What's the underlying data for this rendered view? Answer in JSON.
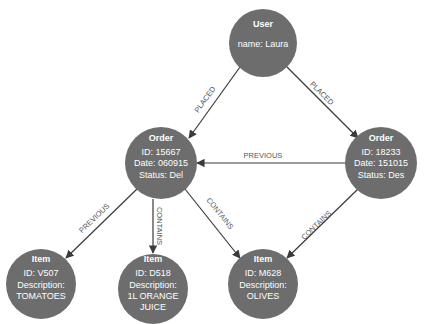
{
  "diagram": {
    "type": "graph",
    "colors": {
      "node_fill": "#6d6d6d",
      "node_text": "#ffffff",
      "edge": "#3a3a3a",
      "edge_label": "#555555",
      "background": "#ffffff"
    },
    "nodes": [
      {
        "id": "user",
        "title": "User",
        "lines": [
          "name: Laura"
        ]
      },
      {
        "id": "order1",
        "title": "Order",
        "lines": [
          "ID: 15667",
          "Date: 060915",
          "Status: Del"
        ]
      },
      {
        "id": "order2",
        "title": "Order",
        "lines": [
          "ID: 18233",
          "Date: 151015",
          "Status: Des"
        ]
      },
      {
        "id": "item1",
        "title": "Item",
        "lines": [
          "ID: V507",
          "Description:",
          "TOMATOES"
        ]
      },
      {
        "id": "item2",
        "title": "Item",
        "lines": [
          "ID: D518",
          "Description:",
          "1L ORANGE",
          "JUICE"
        ]
      },
      {
        "id": "item3",
        "title": "Item",
        "lines": [
          "ID: M628",
          "Description:",
          "OLIVES"
        ]
      }
    ],
    "edges": [
      {
        "from": "user",
        "to": "order1",
        "label": "PLACED"
      },
      {
        "from": "user",
        "to": "order2",
        "label": "PLACED"
      },
      {
        "from": "order2",
        "to": "order1",
        "label": "PREVIOUS"
      },
      {
        "from": "order1",
        "to": "item1",
        "label": "PREVIOUS"
      },
      {
        "from": "order1",
        "to": "item2",
        "label": "CONTAINS"
      },
      {
        "from": "order1",
        "to": "item3",
        "label": "CONTAINS"
      },
      {
        "from": "order2",
        "to": "item3",
        "label": "CONTAINS"
      }
    ]
  }
}
